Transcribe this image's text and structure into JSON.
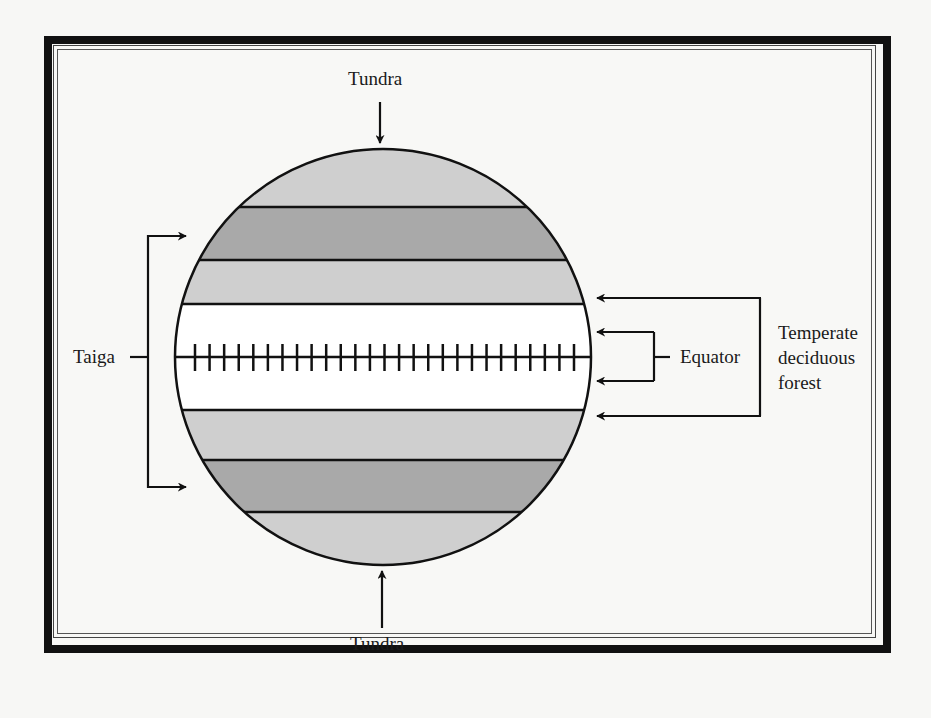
{
  "diagram": {
    "labels": {
      "tundra_top": "Tundra",
      "tundra_bottom": "Tundra",
      "taiga": "Taiga",
      "equator": "Equator",
      "temperate_line1": "Temperate",
      "temperate_line2": "deciduous",
      "temperate_line3": "forest"
    },
    "bands": [
      {
        "name": "tundra-north",
        "fill": "#cfcfcf"
      },
      {
        "name": "taiga-north",
        "fill": "#a9a9a9"
      },
      {
        "name": "temperate-north",
        "fill": "#cfcfcf"
      },
      {
        "name": "equatorial",
        "fill": "#ffffff"
      },
      {
        "name": "temperate-south",
        "fill": "#cfcfcf"
      },
      {
        "name": "taiga-south",
        "fill": "#a9a9a9"
      },
      {
        "name": "tundra-south",
        "fill": "#cfcfcf"
      }
    ],
    "equator_tick_count": 27,
    "colors": {
      "line": "#111111",
      "light_band": "#cfcfcf",
      "dark_band": "#a9a9a9",
      "background": "#f7f7f5"
    }
  }
}
